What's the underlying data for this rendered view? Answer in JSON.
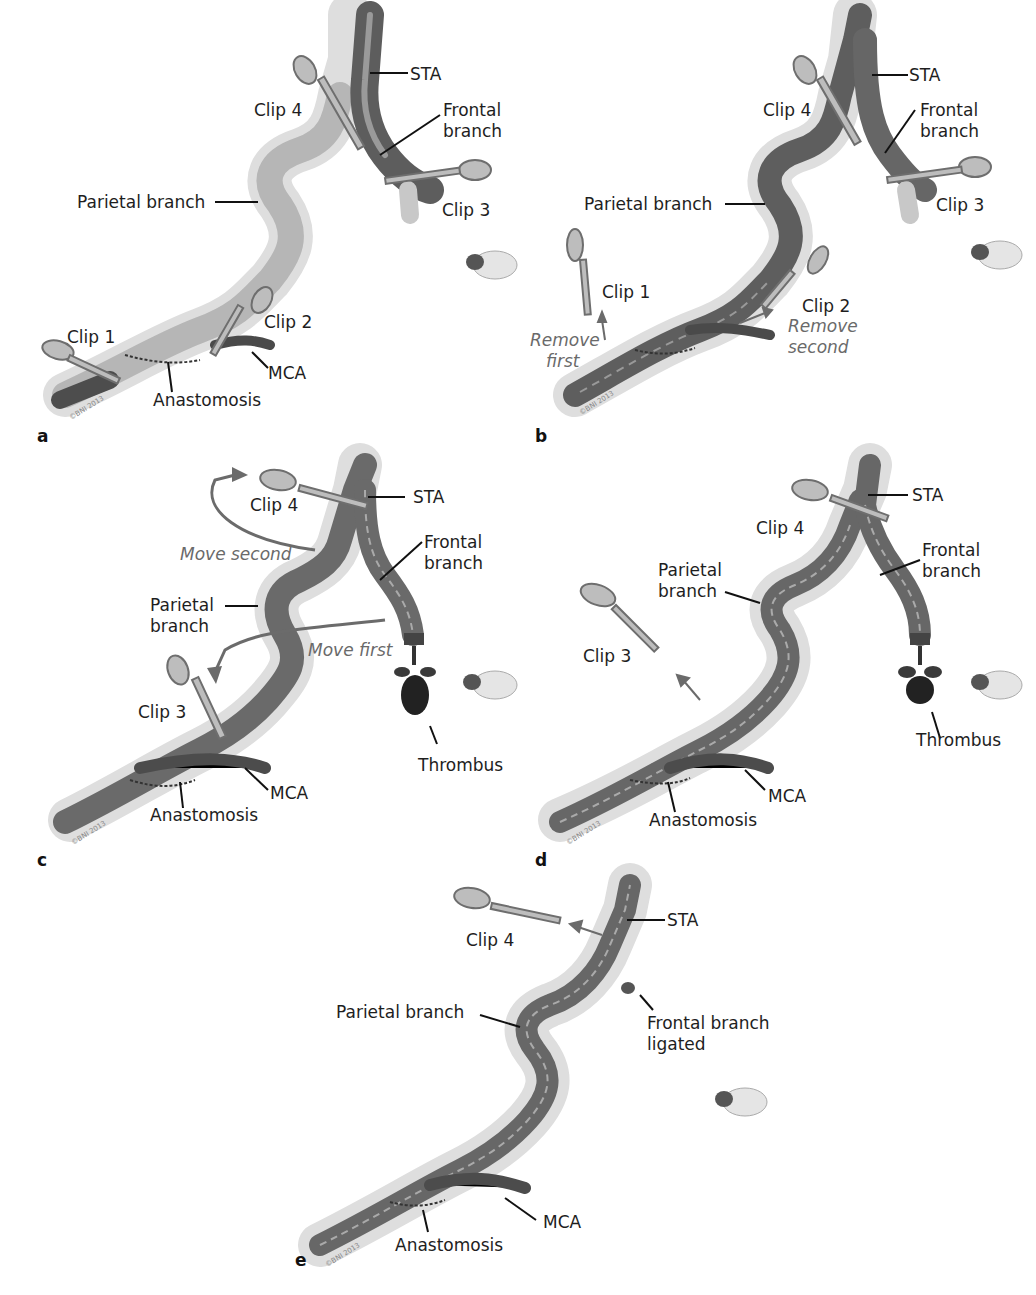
{
  "figure": {
    "panels": [
      {
        "id": "a",
        "letter": "a",
        "labels": {
          "sta": "STA",
          "frontal": "Frontal\nbranch",
          "frontal_l1": "Frontal",
          "frontal_l2": "branch",
          "clip4": "Clip 4",
          "clip3": "Clip 3",
          "parietal": "Parietal branch",
          "clip1": "Clip 1",
          "clip2": "Clip 2",
          "mca": "MCA",
          "anastomosis": "Anastomosis"
        },
        "copyright": "©BNI 2013",
        "state": "Parietal branch pale (no flow); clips 1 and 2 on MCA, clips 3 and 4 on STA branches"
      },
      {
        "id": "b",
        "letter": "b",
        "labels": {
          "sta": "STA",
          "frontal_l1": "Frontal",
          "frontal_l2": "branch",
          "clip4": "Clip 4",
          "clip3": "Clip 3",
          "parietal": "Parietal branch",
          "clip1": "Clip 1",
          "clip2": "Clip 2",
          "remove_first_l1": "Remove",
          "remove_first_l2": "first",
          "remove_second_l1": "Remove",
          "remove_second_l2": "second"
        },
        "copyright": "©BNI 2013"
      },
      {
        "id": "c",
        "letter": "c",
        "labels": {
          "sta": "STA",
          "clip4": "Clip 4",
          "move_second": "Move second",
          "frontal_l1": "Frontal",
          "frontal_l2": "branch",
          "parietal_l1": "Parietal",
          "parietal_l2": "branch",
          "move_first": "Move first",
          "clip3": "Clip 3",
          "thrombus": "Thrombus",
          "mca": "MCA",
          "anastomosis": "Anastomosis"
        },
        "copyright": "©BNI 2013"
      },
      {
        "id": "d",
        "letter": "d",
        "labels": {
          "sta": "STA",
          "clip4": "Clip 4",
          "frontal_l1": "Frontal",
          "frontal_l2": "branch",
          "parietal_l1": "Parietal",
          "parietal_l2": "branch",
          "clip3": "Clip 3",
          "thrombus": "Thrombus",
          "mca": "MCA",
          "anastomosis": "Anastomosis"
        },
        "copyright": "©BNI 2013"
      },
      {
        "id": "e",
        "letter": "e",
        "labels": {
          "clip4": "Clip 4",
          "sta": "STA",
          "parietal": "Parietal branch",
          "frontal_ligated_l1": "Frontal branch",
          "frontal_ligated_l2": "ligated",
          "mca": "MCA",
          "anastomosis": "Anastomosis"
        },
        "copyright": "©BNI 2013"
      }
    ],
    "colors": {
      "vessel_dark": "#5a5a5a",
      "vessel_mid": "#7d7d7d",
      "vessel_pale": "#c9c9c9",
      "adventitia": "#d8d8d8",
      "clip": "#b5b5b5",
      "clip_outline": "#6e6e6e",
      "arrow_gray": "#6b6b6b",
      "thrombus": "#2a2a2a",
      "text": "#1e1e1e",
      "italic_text": "#6a6a6a"
    }
  }
}
